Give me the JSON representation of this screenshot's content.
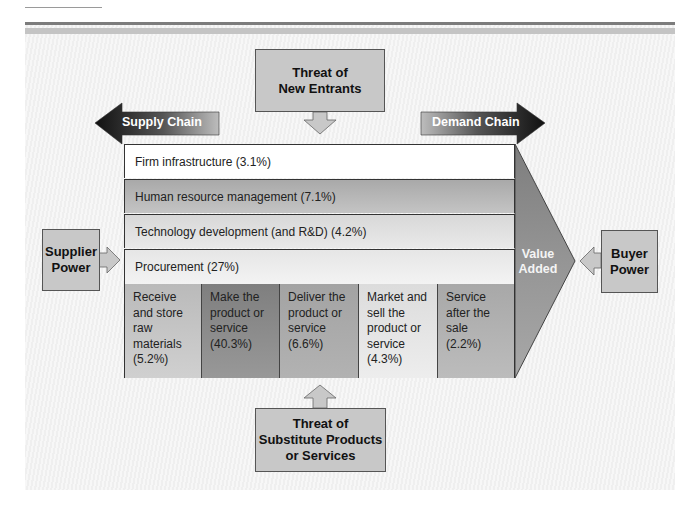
{
  "diagram": {
    "title_elements": {
      "threat_new_entrants": [
        "Threat of",
        "New Entrants"
      ],
      "threat_substitutes": [
        "Threat of",
        "Substitute Products",
        "or Services"
      ],
      "supplier_power": [
        "Supplier",
        "Power"
      ],
      "buyer_power": [
        "Buyer",
        "Power"
      ],
      "supply_chain": "Supply Chain",
      "demand_chain": "Demand Chain",
      "value_added": [
        "Value",
        "Added"
      ]
    },
    "support_activities": [
      {
        "label": "Firm infrastructure (3.1%)",
        "color": "#ffffff"
      },
      {
        "label": "Human resource management (7.1%)",
        "color": "#b5b5b5"
      },
      {
        "label": "Technology development (and R&D) (4.2%)",
        "color": "#e2e2e2"
      },
      {
        "label": "Procurement (27%)",
        "color": "#ededed"
      }
    ],
    "primary_activities": [
      {
        "label": "Receive and store raw materials (5.2%)",
        "color": "#c2c2c2"
      },
      {
        "label": "Make the product or service (40.3%)",
        "color": "#8a8a8a"
      },
      {
        "label": "Deliver the product or service (6.6%)",
        "color": "#a9a9a9"
      },
      {
        "label": "Market and sell the product or service (4.3%)",
        "color": "#e4e4e4"
      },
      {
        "label": "Service after the sale (2.2%)",
        "color": "#b2b2b2"
      }
    ],
    "colors": {
      "box_gray": "#c8c8c8",
      "chevron_gray": "#8f8f8f",
      "arrow_dark": "#1a1a1a"
    }
  }
}
